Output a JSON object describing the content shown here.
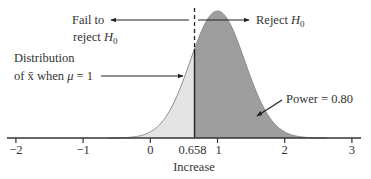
{
  "chart_data": {
    "type": "area",
    "title": "",
    "xlabel": "Increase",
    "ylabel": "",
    "xlim": [
      -2,
      3
    ],
    "x_ticks": [
      -2,
      -1,
      0,
      0.658,
      1,
      2,
      3
    ],
    "x_tick_labels": [
      "−2",
      "−1",
      "0",
      "0.658",
      "1",
      "2",
      "3"
    ],
    "grid": false,
    "distribution": {
      "kind": "normal",
      "mean": 1,
      "sd": 0.406
    },
    "critical_value": 0.658,
    "regions": [
      {
        "name": "Fail to reject H0",
        "from": -2,
        "to": 0.658,
        "fill": "#e6e6e6"
      },
      {
        "name": "Reject H0 (Power)",
        "from": 0.658,
        "to": 3,
        "fill": "#a0a0a0"
      }
    ],
    "power": 0.8,
    "annotations": [
      {
        "text": "Fail to reject H0",
        "arrow": "left"
      },
      {
        "text": "Reject H0",
        "arrow": "right"
      },
      {
        "text": "Distribution of x̄ when μ = 1",
        "arrow": "points to curve"
      },
      {
        "text": "Power = 0.80",
        "arrow": "points to shaded region"
      }
    ]
  },
  "labels": {
    "fail_line1": "Fail to",
    "fail_line2_prefix": "reject ",
    "reject_prefix": "Reject ",
    "h": "H",
    "sub0": "0",
    "dist_line1": "Distribution",
    "dist_line2_prefix": "of ",
    "xbar": "x̄",
    "dist_line2_mid": " when ",
    "mu": "μ",
    "dist_line2_suffix": " = 1",
    "power": "Power = 0.80",
    "xlabel": "Increase"
  },
  "ticks": [
    {
      "label": "−2",
      "value": -2
    },
    {
      "label": "−1",
      "value": -1
    },
    {
      "label": "0",
      "value": 0
    },
    {
      "label": "0.658",
      "value": 0.658
    },
    {
      "label": "1",
      "value": 1
    },
    {
      "label": "2",
      "value": 2
    },
    {
      "label": "3",
      "value": 3
    }
  ],
  "colors": {
    "light_fill": "#e4e4e4",
    "dark_fill": "#9e9e9e",
    "curve": "#8a8a8a",
    "axis": "#333333"
  }
}
